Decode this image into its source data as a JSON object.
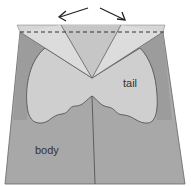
{
  "diagram": {
    "labels": {
      "tail": "tail",
      "body": "body"
    },
    "arrows": [
      {
        "name": "arrow-left",
        "direction": "up-left"
      },
      {
        "name": "arrow-right",
        "direction": "down-right"
      }
    ],
    "colors": {
      "background": "#ffffff",
      "body": "#a8a8a8",
      "body_side": "#9a9a9a",
      "tail": "#cfcfcf",
      "flap_light": "#dddddd",
      "flap_mid": "#c6c6c6",
      "top_strip": "#d6d6d6",
      "line": "#555555",
      "arrow": "#222222"
    }
  }
}
